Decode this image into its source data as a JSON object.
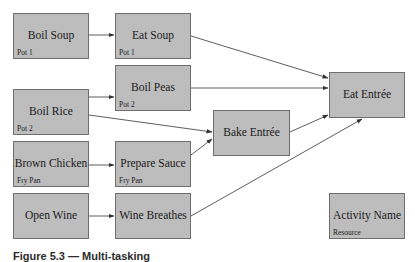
{
  "diagram": {
    "type": "activity-network",
    "nodes": [
      {
        "id": "boil_soup",
        "name": "Boil Soup",
        "resource": "Pot 1",
        "x": 13,
        "y": 13,
        "w": 76,
        "h": 46
      },
      {
        "id": "eat_soup",
        "name": "Eat Soup",
        "resource": "Pot 1",
        "x": 115,
        "y": 13,
        "w": 76,
        "h": 46
      },
      {
        "id": "boil_peas",
        "name": "Boil Peas",
        "resource": "Pot 2",
        "x": 115,
        "y": 65,
        "w": 76,
        "h": 46
      },
      {
        "id": "boil_rice",
        "name": "Boil Rice",
        "resource": "Pot 2",
        "x": 13,
        "y": 89,
        "w": 76,
        "h": 46
      },
      {
        "id": "brown_chicken",
        "name": "Brown Chicken",
        "resource": "Fry Pan",
        "x": 13,
        "y": 141,
        "w": 76,
        "h": 46
      },
      {
        "id": "prepare_sauce",
        "name": "Prepare Sauce",
        "resource": "Fry Pan",
        "x": 115,
        "y": 141,
        "w": 76,
        "h": 46
      },
      {
        "id": "open_wine",
        "name": "Open Wine",
        "resource": "",
        "x": 13,
        "y": 193,
        "w": 76,
        "h": 46
      },
      {
        "id": "wine_breathes",
        "name": "Wine Breathes",
        "resource": "",
        "x": 115,
        "y": 193,
        "w": 76,
        "h": 46
      },
      {
        "id": "bake_entree",
        "name": "Bake Entrée",
        "resource": "",
        "x": 213,
        "y": 110,
        "w": 77,
        "h": 46
      },
      {
        "id": "eat_entree",
        "name": "Eat Entrée",
        "resource": "",
        "x": 329,
        "y": 72,
        "w": 76,
        "h": 46
      },
      {
        "id": "legend",
        "name": "Activity Name",
        "resource": "Resource",
        "x": 329,
        "y": 193,
        "w": 76,
        "h": 46
      }
    ],
    "edges": [
      {
        "from": "boil_soup",
        "to": "eat_soup"
      },
      {
        "from": "eat_soup",
        "to": "eat_entree"
      },
      {
        "from": "boil_rice",
        "to": "boil_peas"
      },
      {
        "from": "boil_peas",
        "to": "eat_entree"
      },
      {
        "from": "boil_rice",
        "to": "bake_entree"
      },
      {
        "from": "brown_chicken",
        "to": "prepare_sauce"
      },
      {
        "from": "prepare_sauce",
        "to": "bake_entree"
      },
      {
        "from": "bake_entree",
        "to": "eat_entree"
      },
      {
        "from": "open_wine",
        "to": "wine_breathes"
      },
      {
        "from": "wine_breathes",
        "to": "eat_entree"
      }
    ],
    "colors": {
      "node_fill": "#bdbdbd",
      "node_border": "#6e6e6e",
      "edge": "#333333",
      "text": "#1a1a1a"
    }
  },
  "caption": {
    "text": "Figure 5.3 — Multi-tasking"
  }
}
